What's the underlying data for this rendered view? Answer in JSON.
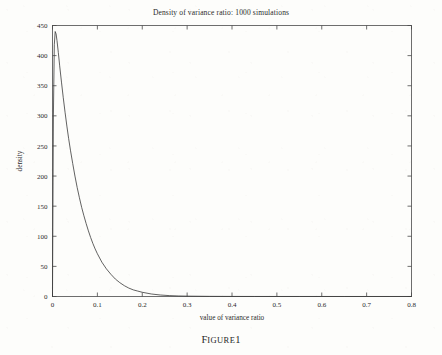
{
  "figure": {
    "caption_lead": "F",
    "caption_rest": "IGURE",
    "caption_number": "1",
    "caption_full": "FIGURE 1"
  },
  "chart_data": {
    "type": "line",
    "title": "Density of variance ratio: 1000 simulations",
    "xlabel": "value of variance ratio",
    "ylabel": "density",
    "xlim": [
      0,
      0.8
    ],
    "ylim": [
      0,
      450
    ],
    "grid": false,
    "legend": null,
    "xticks": [
      0,
      0.1,
      0.2,
      0.3,
      0.4,
      0.5,
      0.6,
      0.7,
      0.8
    ],
    "xticklabels": [
      "0",
      "0.1",
      "0.2",
      "0.3",
      "0.4",
      "0.5",
      "0.6",
      "0.7",
      "0.8"
    ],
    "yticks": [
      0,
      50,
      100,
      150,
      200,
      250,
      300,
      350,
      400,
      450
    ],
    "yticklabels": [
      "0",
      "50",
      "100",
      "150",
      "200",
      "250",
      "300",
      "350",
      "400",
      "450"
    ],
    "line_color": "#3a3a3a",
    "line_width": 0.8,
    "series": [
      {
        "name": "density of variance ratio",
        "x": [
          0.0,
          0.002,
          0.004,
          0.006,
          0.008,
          0.01,
          0.013,
          0.016,
          0.02,
          0.024,
          0.028,
          0.032,
          0.036,
          0.04,
          0.045,
          0.05,
          0.055,
          0.06,
          0.065,
          0.07,
          0.075,
          0.08,
          0.085,
          0.09,
          0.095,
          0.1,
          0.11,
          0.12,
          0.13,
          0.14,
          0.15,
          0.16,
          0.17,
          0.18,
          0.19,
          0.2,
          0.22,
          0.24,
          0.26,
          0.28,
          0.3,
          0.35,
          0.4,
          0.45,
          0.5,
          0.55,
          0.6,
          0.65,
          0.7,
          0.75,
          0.8
        ],
        "y": [
          0,
          300,
          418,
          440,
          436,
          425,
          405,
          383,
          356,
          330,
          306,
          283,
          262,
          243,
          221,
          200,
          181,
          164,
          148,
          134,
          121,
          109,
          98,
          88,
          79,
          71,
          57,
          46,
          37,
          29,
          23,
          18,
          14,
          11,
          9,
          7,
          4.2,
          2.5,
          1.5,
          0.9,
          0.6,
          0.25,
          0.12,
          0.07,
          0.05,
          0.04,
          0.03,
          0.02,
          0.02,
          0.01,
          0.01
        ]
      }
    ]
  }
}
